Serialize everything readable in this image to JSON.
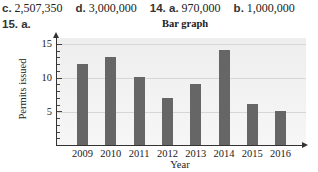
{
  "answers": [
    {
      "label": "c.",
      "value": "2,507,350"
    },
    {
      "label": "d.",
      "value": "3,000,000"
    },
    {
      "label": "14. a.",
      "value": "970,000"
    },
    {
      "label": "b.",
      "value": "1,000,000"
    }
  ],
  "question": {
    "number": "15.",
    "part": "a."
  },
  "chart_data": {
    "type": "bar",
    "title": "Bar graph",
    "xlabel": "Year",
    "ylabel": "Permits issued",
    "categories": [
      "2009",
      "2010",
      "2011",
      "2012",
      "2013",
      "2014",
      "2015",
      "2016"
    ],
    "values": [
      12,
      13,
      10,
      7,
      9,
      14,
      6,
      5
    ],
    "ylim": [
      0,
      16
    ],
    "yticks": [
      "5",
      "10",
      "15"
    ],
    "grid": true,
    "legend": null,
    "colors": {
      "bar": "#666666",
      "plot_bg": "#eeeeee",
      "grid": "#d6d6d6"
    }
  }
}
